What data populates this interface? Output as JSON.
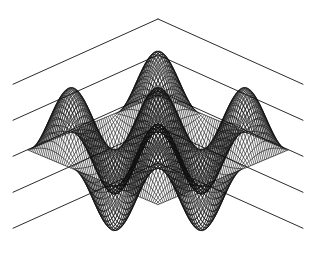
{
  "figure": {
    "title": "",
    "background_color": "#ffffff",
    "ink_color": "#101010",
    "axis_color": "#2b2b2b",
    "width_px": 316,
    "height_px": 258
  },
  "chart_data": {
    "type": "line",
    "render_style": "3d-surface-wireframe-mesh",
    "title": "",
    "subtitle": "",
    "xlabel": "",
    "ylabel": "",
    "zlabel": "",
    "grid": true,
    "legend": false,
    "legend_position": "none",
    "axis_tick_labels": [],
    "annotations": [],
    "surface": {
      "function": "z = cos(1.5*pi*x) * cos(1.5*pi*y)",
      "x": {
        "min": -1,
        "max": 1,
        "samples": 74
      },
      "y": {
        "min": -1,
        "max": 1,
        "samples": 74
      },
      "zlim": [
        -1,
        1
      ],
      "peaks_visible": 3,
      "troughs_visible": 3
    },
    "projection": {
      "type": "isometric-perspective",
      "azimuth_deg": -37.5,
      "elevation_deg": 30,
      "center_x_px": 158,
      "center_y_px": 150,
      "half_width_px": 130,
      "depth_squash": 0.42,
      "height_scale_px": 62
    },
    "backdrop_grid_lines": {
      "count_per_side": 5,
      "apex_x_px": 158,
      "apex_y_px_first": 19,
      "apex_y_step_px": 36,
      "slope": 0.45,
      "span_px": 145
    },
    "series": [
      {
        "name": "surface-mesh-u",
        "orientation": "rows",
        "values": []
      },
      {
        "name": "surface-mesh-v",
        "orientation": "columns",
        "values": []
      }
    ]
  }
}
